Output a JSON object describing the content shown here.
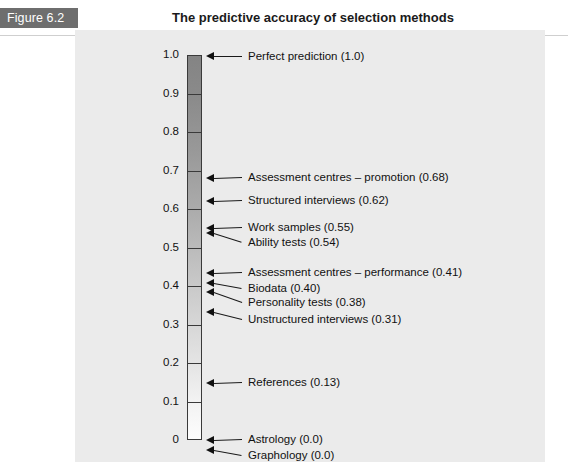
{
  "header": {
    "figure_tag": "Figure 6.2",
    "title": "The predictive accuracy of selection methods",
    "tag_bg": "#6e6e6e",
    "tag_color": "#ffffff"
  },
  "panel": {
    "background": "#ebebeb"
  },
  "chart_data": {
    "type": "bar",
    "title": "The predictive accuracy of selection methods",
    "xlabel": "",
    "ylabel": "",
    "ylim": [
      0,
      1.0
    ],
    "orientation": "vertical-scale",
    "grid": false,
    "legend": "none",
    "axis_ticks": [
      "1.0",
      "0.9",
      "0.8",
      "0.7",
      "0.6",
      "0.5",
      "0.4",
      "0.3",
      "0.2",
      "0.1",
      "0"
    ],
    "axis_tick_values": [
      1.0,
      0.9,
      0.8,
      0.7,
      0.6,
      0.5,
      0.4,
      0.3,
      0.2,
      0.1,
      0.0
    ],
    "categories": [
      "Perfect prediction",
      "Assessment centres – promotion",
      "Structured interviews",
      "Work samples",
      "Ability tests",
      "Assessment centres – performance",
      "Biodata",
      "Personality tests",
      "Unstructured interviews",
      "References",
      "Astrology",
      "Graphology"
    ],
    "values": [
      1.0,
      0.68,
      0.62,
      0.55,
      0.54,
      0.41,
      0.4,
      0.38,
      0.31,
      0.13,
      0.0,
      0.0
    ],
    "points": [
      {
        "label": "Perfect prediction (1.0)",
        "value": 1.0,
        "arrow_y": 56,
        "text_y": 50,
        "text_x": 248,
        "leader_len": 42
      },
      {
        "label": "Assessment centres – promotion (0.68)",
        "value": 0.68,
        "arrow_y": 178,
        "text_y": 171,
        "text_x": 248,
        "leader_len": 42
      },
      {
        "label": "Structured interviews (0.62)",
        "value": 0.62,
        "arrow_y": 201,
        "text_y": 194,
        "text_x": 248,
        "leader_len": 42
      },
      {
        "label": "Work samples (0.55)",
        "value": 0.55,
        "arrow_y": 228,
        "text_y": 221,
        "text_x": 248,
        "leader_len": 42
      },
      {
        "label": "Ability tests (0.54)",
        "value": 0.54,
        "arrow_y": 233,
        "text_y": 236,
        "text_x": 248,
        "leader_len": 42
      },
      {
        "label": "Assessment centres – performance (0.41)",
        "value": 0.41,
        "arrow_y": 273,
        "text_y": 266,
        "text_x": 248,
        "leader_len": 42
      },
      {
        "label": "Biodata (0.40)",
        "value": 0.4,
        "arrow_y": 283,
        "text_y": 282,
        "text_x": 248,
        "leader_len": 42
      },
      {
        "label": "Personality tests (0.38)",
        "value": 0.38,
        "arrow_y": 292,
        "text_y": 296,
        "text_x": 248,
        "leader_len": 42
      },
      {
        "label": "Unstructured interviews (0.31)",
        "value": 0.31,
        "arrow_y": 312,
        "text_y": 313,
        "text_x": 248,
        "leader_len": 42
      },
      {
        "label": "References (0.13)",
        "value": 0.13,
        "arrow_y": 383,
        "text_y": 376,
        "text_x": 248,
        "leader_len": 42
      },
      {
        "label": "Astrology (0.0)",
        "value": 0.0,
        "arrow_y": 440,
        "text_y": 433,
        "text_x": 248,
        "leader_len": 42
      },
      {
        "label": "Graphology (0.0)",
        "value": 0.0,
        "arrow_y": 450,
        "text_y": 449,
        "text_x": 248,
        "leader_len": 42
      }
    ]
  }
}
